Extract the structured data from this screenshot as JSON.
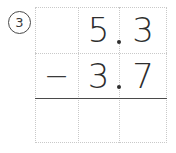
{
  "problem": {
    "number_label": "3",
    "operation": "subtraction",
    "operator_symbol": "−",
    "minuend": "5.3",
    "subtrahend": "3.7",
    "answer": ""
  },
  "grid": {
    "columns": 3,
    "rows": 3,
    "column_names": [
      "operator-column",
      "ones-column",
      "tenths-column"
    ]
  },
  "rows": {
    "minuend_row": {
      "operator_cell": "",
      "ones_cell": "5",
      "decimal_point": ".",
      "tenths_cell": "3"
    },
    "subtrahend_row": {
      "operator_cell": "−",
      "ones_cell": "3",
      "decimal_point": ".",
      "tenths_cell": "7"
    },
    "answer_row": {
      "operator_cell": "",
      "ones_cell": "",
      "tenths_cell": ""
    }
  },
  "colors": {
    "ink": "#2e2e2e",
    "rule": "#4a4a4a",
    "gridline": "#c9c9c9",
    "background": "#ffffff"
  }
}
